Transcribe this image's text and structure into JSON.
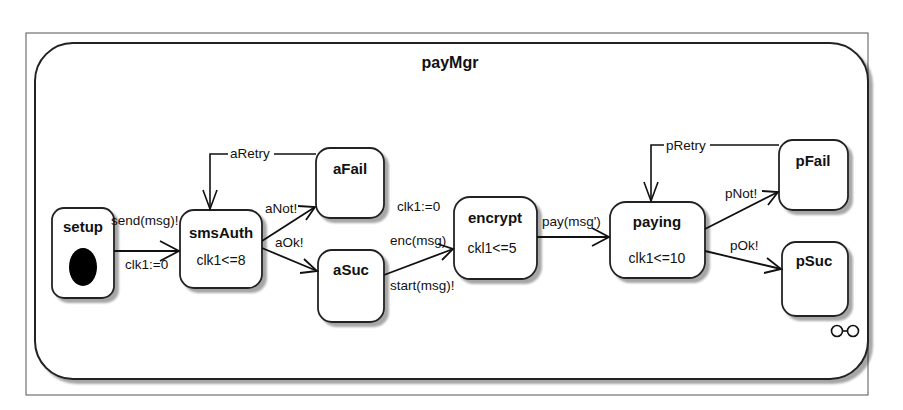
{
  "diagram": {
    "title": "payMgr",
    "states": [
      {
        "id": "setup",
        "name": "setup",
        "invariant": "",
        "initial": true
      },
      {
        "id": "smsAuth",
        "name": "smsAuth",
        "invariant": "clk1<=8"
      },
      {
        "id": "aFail",
        "name": "aFail",
        "invariant": ""
      },
      {
        "id": "aSuc",
        "name": "aSuc",
        "invariant": ""
      },
      {
        "id": "encrypt",
        "name": "encrypt",
        "invariant": "ckl1<=5"
      },
      {
        "id": "paying",
        "name": "paying",
        "invariant": "clk1<=10"
      },
      {
        "id": "pFail",
        "name": "pFail",
        "invariant": ""
      },
      {
        "id": "pSuc",
        "name": "pSuc",
        "invariant": ""
      }
    ],
    "transitions": [
      {
        "from": "setup",
        "to": "smsAuth",
        "sync": "send(msg)!",
        "update": "clk1:=0"
      },
      {
        "from": "smsAuth",
        "to": "aFail",
        "sync": "aNot!"
      },
      {
        "from": "smsAuth",
        "to": "aSuc",
        "sync": "aOk!"
      },
      {
        "from": "aFail",
        "to": "smsAuth",
        "label": "aRetry"
      },
      {
        "from": "aSuc",
        "to": "encrypt",
        "update": "clk1:=0",
        "sync_in": "enc(msg)",
        "sync_out": "start(msg)!"
      },
      {
        "from": "encrypt",
        "to": "paying",
        "sync": "pay(msg')"
      },
      {
        "from": "paying",
        "to": "pFail",
        "sync": "pNot!"
      },
      {
        "from": "paying",
        "to": "pSuc",
        "sync": "pOk!"
      },
      {
        "from": "pFail",
        "to": "paying",
        "label": "pRetry"
      }
    ],
    "corner_icon": "decomposition-icon"
  }
}
